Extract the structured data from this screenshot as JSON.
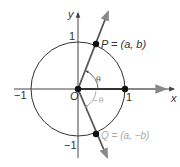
{
  "figure": {
    "type": "unit-circle-diagram",
    "axes": {
      "x_label": "x",
      "y_label": "y",
      "origin_label": "O",
      "tick_pos_x": "1",
      "tick_neg_x": "−1",
      "tick_pos_y": "1",
      "tick_neg_y": "−1"
    },
    "points": {
      "P": {
        "label": "P = (a, b)",
        "name": "P",
        "coords": "(a, b)"
      },
      "Q": {
        "label": "Q = (a, −b)",
        "name": "Q",
        "coords": "(a, −b)"
      }
    },
    "angles": {
      "theta": "θ",
      "neg_theta": "−θ"
    },
    "colors": {
      "primary": "#333333",
      "secondary": "#a8a8a8",
      "ray": "#555555",
      "point": "#111111"
    }
  }
}
